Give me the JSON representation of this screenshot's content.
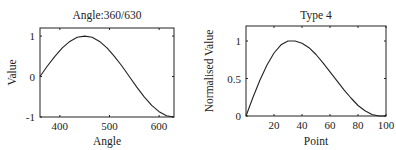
{
  "chart_data": [
    {
      "type": "line",
      "title": "Angle:360/630",
      "xlabel": "Angle",
      "ylabel": "Value",
      "xlim": [
        360,
        630
      ],
      "ylim": [
        -1,
        1.2
      ],
      "xticks": [
        400,
        500,
        600
      ],
      "yticks": [
        -1,
        0,
        1
      ],
      "xtick_labels": [
        "400",
        "500",
        "600"
      ],
      "ytick_labels": [
        "-1",
        "0",
        "1"
      ],
      "grid": false,
      "series": [
        {
          "name": "sin(angle)",
          "x": [
            360,
            375,
            390,
            405,
            420,
            435,
            450,
            465,
            480,
            495,
            510,
            525,
            540,
            555,
            570,
            585,
            600,
            615,
            630
          ],
          "values": [
            0.0,
            0.26,
            0.5,
            0.71,
            0.87,
            0.97,
            1.0,
            0.97,
            0.87,
            0.71,
            0.5,
            0.26,
            0.0,
            -0.26,
            -0.5,
            -0.71,
            -0.87,
            -0.97,
            -1.0
          ]
        }
      ]
    },
    {
      "type": "line",
      "title": "Type 4",
      "xlabel": "Point",
      "ylabel": "Normalised Value",
      "xlim": [
        0,
        100
      ],
      "ylim": [
        0,
        1.2
      ],
      "xticks": [
        20,
        40,
        60,
        80,
        100
      ],
      "yticks": [
        0,
        0.5,
        1
      ],
      "xtick_labels": [
        "20",
        "40",
        "60",
        "80",
        "100"
      ],
      "ytick_labels": [
        "0",
        "0.5",
        "1"
      ],
      "grid": false,
      "series": [
        {
          "name": "Type 4",
          "x": [
            0,
            5,
            10,
            15,
            20,
            25,
            30,
            35,
            40,
            45,
            50,
            55,
            60,
            65,
            70,
            75,
            80,
            85,
            90,
            95,
            100
          ],
          "values": [
            0.0,
            0.25,
            0.48,
            0.68,
            0.84,
            0.95,
            1.0,
            1.0,
            0.97,
            0.91,
            0.82,
            0.71,
            0.59,
            0.47,
            0.35,
            0.24,
            0.14,
            0.07,
            0.02,
            0.0,
            0.0
          ]
        }
      ]
    }
  ]
}
